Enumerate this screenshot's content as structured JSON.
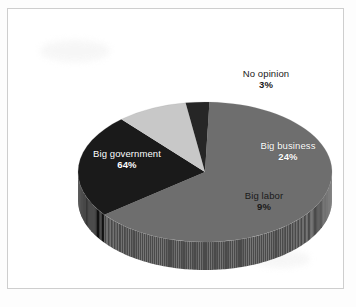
{
  "figure": {
    "background_color": "#ffffff",
    "frame_color": "#d8d8d8"
  },
  "chart_data": {
    "type": "pie",
    "title": "",
    "subtitle": "",
    "xlabel": "",
    "ylabel": "",
    "legend_position": "none",
    "three_d": true,
    "labels_inside": true,
    "categories": [
      "Big government",
      "Big business",
      "Big labor",
      "No opinion"
    ],
    "values": [
      64,
      24,
      9,
      3
    ],
    "value_suffix": "%",
    "colors": [
      "#6e6e6e",
      "#1a1a1a",
      "#c8c8c8",
      "#262626"
    ],
    "side_colors": [
      "#4a4a4a",
      "#111111",
      "#9a9a9a",
      "#161616"
    ],
    "slices": [
      {
        "name": "big-government",
        "label": "Big government",
        "value": 64,
        "value_label": "64%",
        "color": "#6e6e6e",
        "side_color": "#4a4a4a",
        "label_color": "#ffffff"
      },
      {
        "name": "big-business",
        "label": "Big business",
        "value": 24,
        "value_label": "24%",
        "color": "#1a1a1a",
        "side_color": "#111111",
        "label_color": "#ffffff"
      },
      {
        "name": "big-labor",
        "label": "Big labor",
        "value": 9,
        "value_label": "9%",
        "color": "#c8c8c8",
        "side_color": "#9a9a9a",
        "label_color": "#1a1a1a"
      },
      {
        "name": "no-opinion",
        "label": "No opinion",
        "value": 3,
        "value_label": "3%",
        "color": "#262626",
        "side_color": "#161616",
        "label_color": "#1a1a1a"
      }
    ]
  }
}
